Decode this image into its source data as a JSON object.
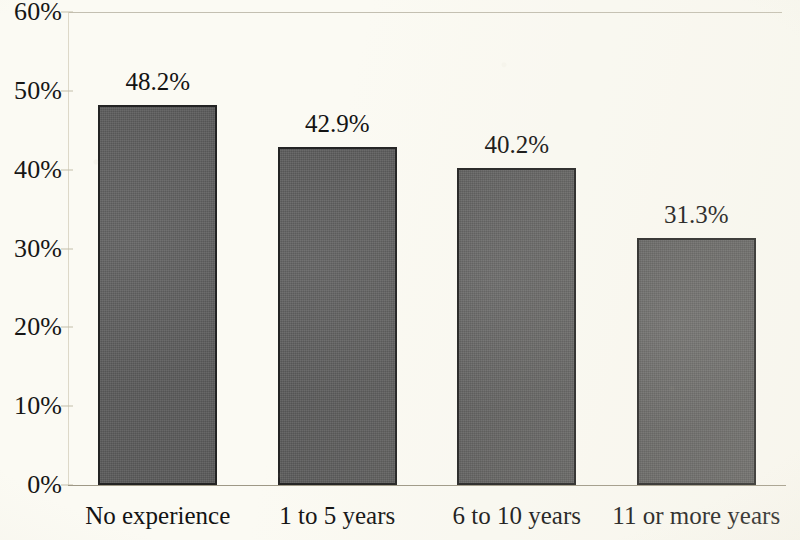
{
  "chart_data": {
    "type": "bar",
    "title": "",
    "subtitle": "",
    "xlabel": "",
    "ylabel": "",
    "categories": [
      "No experience",
      "1 to 5 years",
      "6 to 10 years",
      "11 or more years"
    ],
    "values": [
      48.2,
      42.9,
      40.2,
      31.3
    ],
    "value_labels": [
      "48.2%",
      "42.9%",
      "40.2%",
      "31.3%"
    ],
    "ylim": [
      0,
      60
    ],
    "ytick_values": [
      60,
      50,
      40,
      30,
      20,
      10,
      0
    ],
    "ytick_labels": [
      "60%",
      "50%",
      "40%",
      "30%",
      "20%",
      "10%",
      "0%"
    ],
    "grid": false,
    "legend": null,
    "legend_position": "none",
    "series": [
      {
        "name": "",
        "values": [
          48.2,
          42.9,
          40.2,
          31.3
        ]
      }
    ],
    "colors": {
      "bar_fill": "#5c5c5c",
      "bar_border": "#232323",
      "background": "#fbfaf3",
      "axis": "#9e9886",
      "text": "#131313"
    }
  }
}
